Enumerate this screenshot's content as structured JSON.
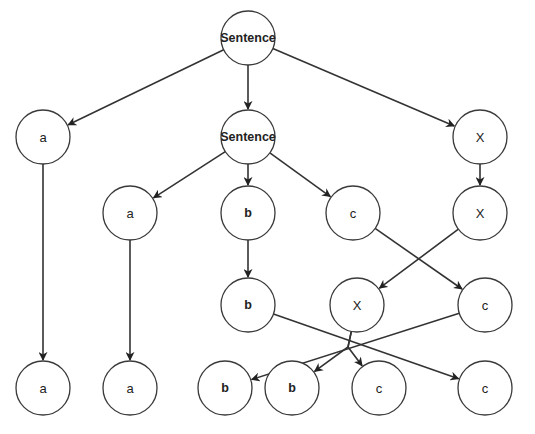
{
  "diagram": {
    "type": "tree",
    "node_radius": 27,
    "colors": {
      "stroke": "#3a3a3a",
      "edge": "#333333",
      "text": "#222222",
      "background": "#ffffff"
    },
    "nodes": [
      {
        "id": "n0",
        "label": "Sentence",
        "x": 248,
        "y": 38,
        "bold": true
      },
      {
        "id": "n1",
        "label": "a",
        "x": 43,
        "y": 137
      },
      {
        "id": "n2",
        "label": "Sentence",
        "x": 248,
        "y": 137,
        "bold": true
      },
      {
        "id": "n3",
        "label": "X",
        "x": 480,
        "y": 137
      },
      {
        "id": "n4",
        "label": "a",
        "x": 130,
        "y": 213
      },
      {
        "id": "n5",
        "label": "b",
        "x": 248,
        "y": 213,
        "bold": true
      },
      {
        "id": "n6",
        "label": "c",
        "x": 353,
        "y": 213
      },
      {
        "id": "n7",
        "label": "X",
        "x": 480,
        "y": 213
      },
      {
        "id": "n8",
        "label": "b",
        "x": 248,
        "y": 305,
        "bold": true
      },
      {
        "id": "n9",
        "label": "X",
        "x": 357,
        "y": 305
      },
      {
        "id": "n10",
        "label": "c",
        "x": 485,
        "y": 305
      },
      {
        "id": "n11",
        "label": "a",
        "x": 43,
        "y": 388
      },
      {
        "id": "n12",
        "label": "a",
        "x": 130,
        "y": 388
      },
      {
        "id": "n13",
        "label": "b",
        "x": 225,
        "y": 388,
        "bold": true
      },
      {
        "id": "n14",
        "label": "b",
        "x": 292,
        "y": 388,
        "bold": true
      },
      {
        "id": "n15",
        "label": "c",
        "x": 379,
        "y": 388
      },
      {
        "id": "n16",
        "label": "c",
        "x": 485,
        "y": 388
      }
    ],
    "edges": [
      {
        "from": "n0",
        "to": "n1"
      },
      {
        "from": "n0",
        "to": "n2"
      },
      {
        "from": "n0",
        "to": "n3"
      },
      {
        "from": "n2",
        "to": "n4"
      },
      {
        "from": "n2",
        "to": "n5"
      },
      {
        "from": "n2",
        "to": "n6"
      },
      {
        "from": "n3",
        "to": "n7"
      },
      {
        "from": "n1",
        "to": "n11"
      },
      {
        "from": "n4",
        "to": "n12"
      },
      {
        "from": "n5",
        "to": "n8"
      },
      {
        "from": "n6",
        "to": "n10"
      },
      {
        "from": "n7",
        "to": "n9"
      },
      {
        "from": "n8",
        "to": "n16"
      },
      {
        "from": "n10",
        "to": "n13"
      },
      {
        "from": "n9",
        "to": "n14",
        "via": [
          348,
          347
        ]
      },
      {
        "from": "n9",
        "to": "n15",
        "via": [
          348,
          347
        ]
      }
    ]
  }
}
